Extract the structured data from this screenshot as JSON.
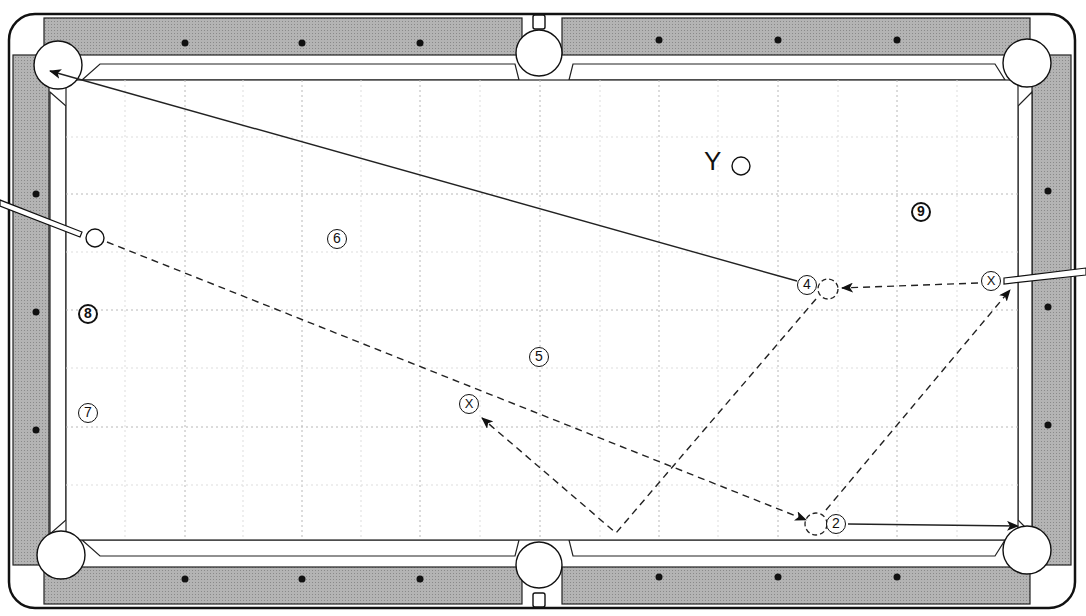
{
  "diagram": {
    "title": "",
    "table": {
      "rail_color": "#a9a9a9",
      "cloth_color": "#ffffff",
      "line_color": "#222222",
      "grid_color": "#bbbbbb"
    },
    "labels": {
      "y_marker": "Y"
    },
    "balls": [
      {
        "id": "ball-2",
        "label": "2",
        "x": 836,
        "y": 524,
        "style": "numbered"
      },
      {
        "id": "ball-4",
        "label": "4",
        "x": 807,
        "y": 285,
        "style": "numbered"
      },
      {
        "id": "ball-5",
        "label": "5",
        "x": 539,
        "y": 357,
        "style": "numbered"
      },
      {
        "id": "ball-6",
        "label": "6",
        "x": 337,
        "y": 239,
        "style": "numbered"
      },
      {
        "id": "ball-7",
        "label": "7",
        "x": 88,
        "y": 413,
        "style": "numbered"
      },
      {
        "id": "ball-8",
        "label": "8",
        "x": 88,
        "y": 314,
        "style": "dark"
      },
      {
        "id": "ball-9",
        "label": "9",
        "x": 921,
        "y": 212,
        "style": "dark"
      },
      {
        "id": "ball-x1",
        "label": "X",
        "x": 469,
        "y": 404,
        "style": "numbered"
      },
      {
        "id": "ball-x2",
        "label": "X",
        "x": 991,
        "y": 281,
        "style": "numbered"
      }
    ],
    "cue_balls": [
      {
        "id": "cue-ball-left",
        "x": 95,
        "y": 238
      },
      {
        "id": "cue-ball-y",
        "x": 741,
        "y": 166
      }
    ],
    "legend": []
  }
}
